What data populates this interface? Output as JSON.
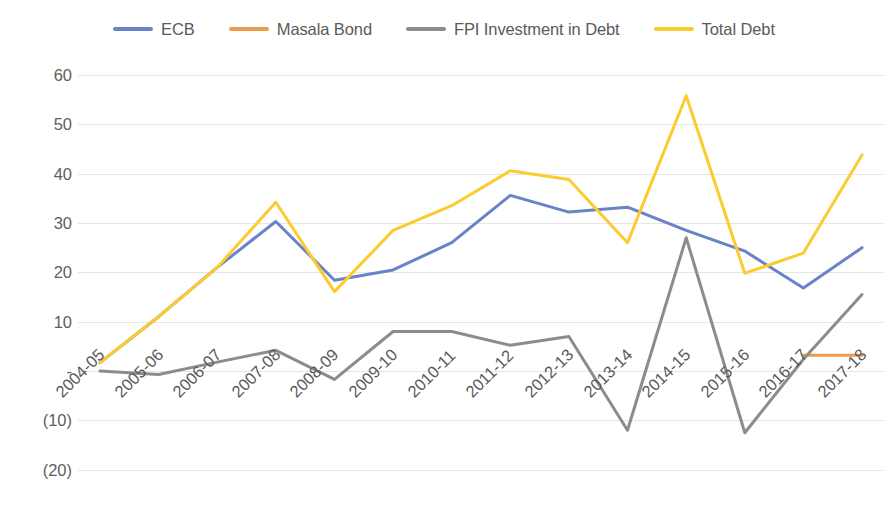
{
  "chart_data": {
    "type": "line",
    "title": "",
    "subtitle": "",
    "xlabel": "",
    "ylabel": "",
    "grid": true,
    "legend_position": "top",
    "ylim": [
      -20,
      60
    ],
    "yticks": [
      60,
      50,
      40,
      30,
      20,
      10,
      0,
      -10,
      -20
    ],
    "ytick_labels": [
      "60",
      "50",
      "40",
      "30",
      "20",
      "10",
      "-",
      "(10)",
      "(20)"
    ],
    "categories": [
      "2004-05",
      "2005-06",
      "2006-07",
      "2007-08",
      "2008-09",
      "2009-10",
      "2010-11",
      "2011-12",
      "2012-13",
      "2013-14",
      "2014-15",
      "2015-16",
      "2016-17",
      "2017-18"
    ],
    "series": [
      {
        "name": "ECB",
        "color": "#6982C8",
        "values": [
          1.7,
          11.0,
          21.0,
          30.3,
          18.4,
          20.5,
          26.0,
          35.6,
          32.2,
          33.2,
          28.5,
          24.3,
          16.8,
          25.0
        ]
      },
      {
        "name": "Masala Bond",
        "color": "#ED9B4E",
        "values": [
          null,
          null,
          null,
          null,
          null,
          null,
          null,
          null,
          null,
          null,
          null,
          null,
          3.2,
          3.2
        ]
      },
      {
        "name": "FPI Investment in Debt",
        "color": "#8C8C8C",
        "values": [
          0.0,
          -0.7,
          1.8,
          4.2,
          -1.7,
          8.0,
          8.0,
          5.2,
          7.0,
          -12.0,
          27.0,
          -12.5,
          2.4,
          15.5
        ]
      },
      {
        "name": "Total Debt",
        "color": "#FCCB2D",
        "values": [
          1.7,
          11.0,
          21.0,
          34.2,
          16.1,
          28.5,
          33.5,
          40.6,
          38.8,
          26.0,
          55.8,
          19.8,
          23.9,
          43.8
        ]
      }
    ]
  }
}
